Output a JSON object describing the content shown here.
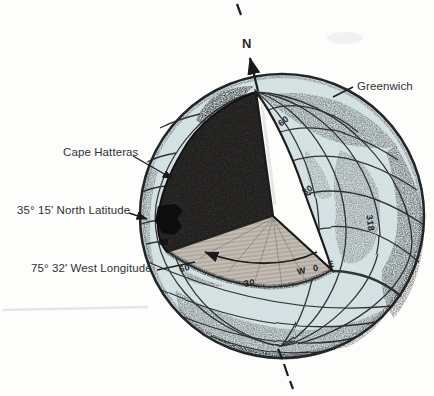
{
  "figure": {
    "labels": {
      "north": "N",
      "greenwich": "Greenwich",
      "cape_hatteras": "Cape Hatteras",
      "latitude": "35° 15' North Latitude",
      "longitude": "75° 32' West Longitude"
    },
    "graticule_labels": [
      {
        "text": "60",
        "x": 278,
        "y": 116,
        "rot": -38
      },
      {
        "text": "30",
        "x": 302,
        "y": 185,
        "rot": -32
      },
      {
        "text": "60",
        "x": 179,
        "y": 263,
        "rot": -14
      },
      {
        "text": "30",
        "x": 244,
        "y": 278,
        "rot": -12
      },
      {
        "text": "W",
        "x": 297,
        "y": 266,
        "rot": -12
      },
      {
        "text": "0",
        "x": 313,
        "y": 263,
        "rot": -12
      },
      {
        "text": "E",
        "x": 328,
        "y": 259,
        "rot": -14
      },
      {
        "text": "318",
        "x": 362,
        "y": 218,
        "rot": 82
      }
    ],
    "colors": {
      "water": "#d9e6e8",
      "ink": "#26282a",
      "paper": "#fdfdfb"
    }
  }
}
